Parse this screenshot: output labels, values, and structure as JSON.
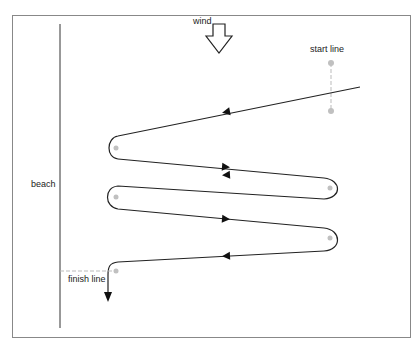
{
  "labels": {
    "wind": "wind",
    "start_line": "start line",
    "beach": "beach",
    "finish_line": "finish line"
  },
  "colors": {
    "frame": "#777777",
    "course": "#222222",
    "mark": "#c0c0c0",
    "dashed": "#bbbbbb"
  }
}
